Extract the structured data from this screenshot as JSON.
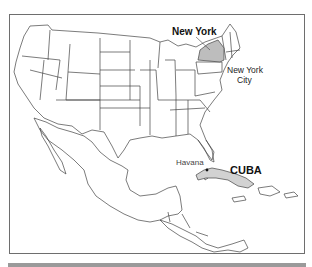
{
  "map": {
    "labels": {
      "new_york_state": "New York",
      "new_york_city_line1": "New York",
      "new_york_city_line2": "City",
      "havana": "Havana",
      "cuba": "CUBA"
    },
    "colors": {
      "outline": "#444444",
      "highlight_fill": "#bdbdbd",
      "frame": "#6e6e6e",
      "bottom_bar": "#9a9a9a"
    },
    "highlighted_regions": [
      "New York",
      "Cuba"
    ]
  }
}
